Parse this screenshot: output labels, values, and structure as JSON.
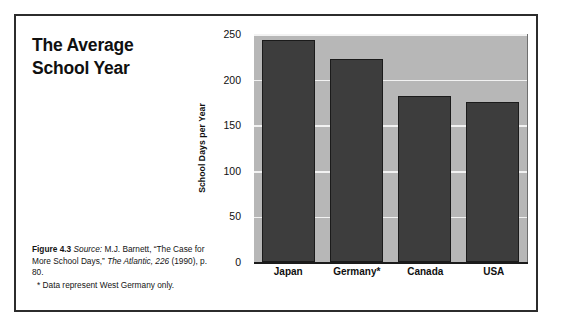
{
  "figure": {
    "title": "The Average\nSchool Year",
    "caption": {
      "figure_label": "Figure 4.3",
      "source_label": "Source:",
      "source_text_1": " M.J. Barnett, “The Case for More School Days,” ",
      "source_italic": "The Atlantic, 226",
      "source_text_2": " (1990), p. 80.",
      "footnote": "* Data represent West Germany only."
    },
    "frame_color": "#2c2c2c"
  },
  "chart_data": {
    "type": "bar",
    "title": "The Average School Year",
    "categories": [
      "Japan",
      "Germany*",
      "Canada",
      "USA"
    ],
    "values": [
      243,
      223,
      182,
      176
    ],
    "xlabel": "",
    "ylabel": "School Days per Year",
    "ylim": [
      0,
      250
    ],
    "yticks": [
      0,
      50,
      100,
      150,
      200,
      250
    ],
    "ytick_labels": [
      "0",
      "50",
      "100",
      "150",
      "200",
      "250"
    ],
    "grid": true,
    "legend": false,
    "colors": {
      "bar_fill": "#3d3d3d",
      "bar_edge": "#1b1b1b",
      "bar_shadow": "#8e8e8e",
      "plot_background": "#b7b7b7",
      "gridline": "#f2f2f2",
      "axis": "#1b1b1b"
    }
  }
}
